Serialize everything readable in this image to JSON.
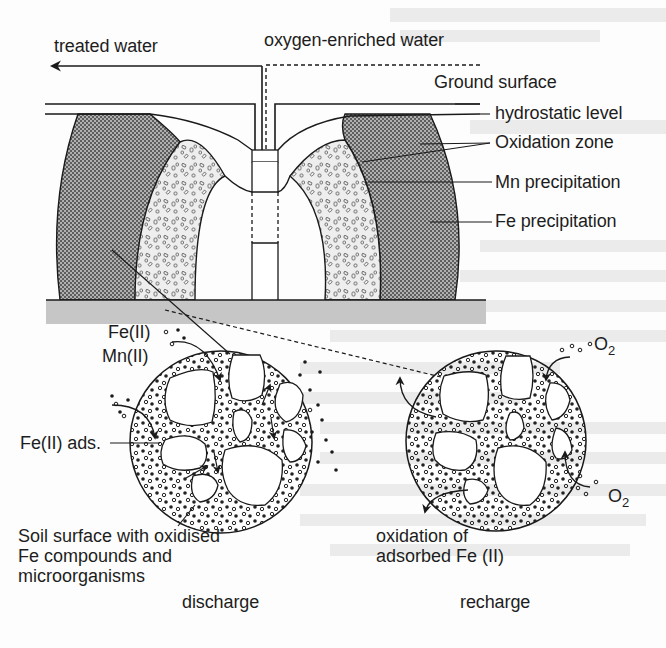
{
  "figure": {
    "well_section": {
      "labels": {
        "treated_water": "treated water",
        "oxygen_enriched_water": "oxygen-enriched water",
        "ground_surface": "Ground surface",
        "hydrostatic_level": "hydrostatic level",
        "oxidation_zone": "Oxidation zone",
        "mn_precipitation": "Mn precipitation",
        "fe_precipitation": "Fe precipitation"
      }
    },
    "discharge_detail": {
      "labels": {
        "fe_ii": "Fe(II)",
        "mn_ii": "Mn(II)",
        "fe_ii_ads": "Fe(II) ads.",
        "soil_surface_line1": "Soil surface with oxidised",
        "soil_surface_line2": "Fe compounds and",
        "soil_surface_line3": "microorganisms",
        "caption": "discharge"
      }
    },
    "recharge_detail": {
      "labels": {
        "o2_top": "O",
        "o2_top_sub": "2",
        "o2_bottom": "O",
        "o2_bottom_sub": "2",
        "oxidation_line1": "oxidation of",
        "oxidation_line2": "adsorbed Fe (II)",
        "caption": "recharge"
      }
    },
    "colors": {
      "line": "#1a1a1a",
      "fe_hatch": "#8a8a8a",
      "mn_speckle": "#e6e6e6",
      "aquitard": "#c4c4c4",
      "bleed_through": "#e9e9e9"
    }
  }
}
